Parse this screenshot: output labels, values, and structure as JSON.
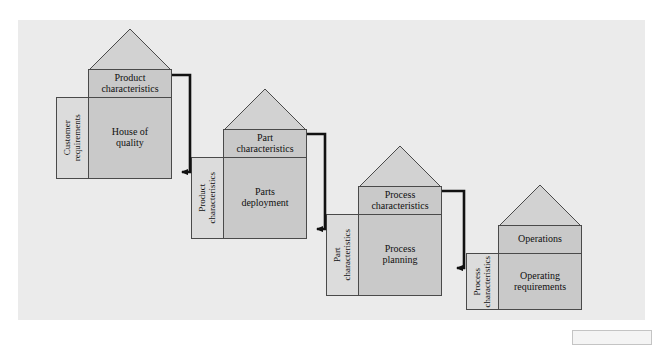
{
  "figure": {
    "panel": {
      "color": "#ebebeb",
      "x": 18,
      "y": 20,
      "width": 627,
      "height": 300
    },
    "colors": {
      "page_background": "#ffffff",
      "panel_background": "#ebebeb",
      "house_fill": "#c9c9c9",
      "roof_fill": "#d2d2d2",
      "side_fill": "#dcdcdc",
      "outline": "#4a4a4a",
      "arrow": "#111111",
      "text": "#101010"
    }
  },
  "houses": [
    {
      "id": "house-of-quality",
      "head_label": "Product\ncharacteristics",
      "head_line1": "Product",
      "head_line2": "characteristics",
      "body_label": "House of\nquality",
      "body_line1": "House of",
      "body_line2": "quality",
      "side_label": "Customer\nrequirements",
      "side_line1": "Customer",
      "side_line2": "requirements"
    },
    {
      "id": "parts-deployment",
      "head_label": "Part\ncharacteristics",
      "head_line1": "Part",
      "head_line2": "characteristics",
      "body_label": "Parts\ndeployment",
      "body_line1": "Parts",
      "body_line2": "deployment",
      "side_label": "Product\ncharacteristics",
      "side_line1": "Product",
      "side_line2": "characteristics"
    },
    {
      "id": "process-planning",
      "head_label": "Process\ncharacteristics",
      "head_line1": "Process",
      "head_line2": "characteristics",
      "body_label": "Process\nplanning",
      "body_line1": "Process",
      "body_line2": "planning",
      "side_label": "Part\ncharacteristics",
      "side_line1": "Part",
      "side_line2": "characteristics"
    },
    {
      "id": "operating-requirements",
      "head_label": "Operations",
      "head_line1": "Operations",
      "head_line2": "",
      "body_label": "Operating\nrequirements",
      "body_line1": "Operating",
      "body_line2": "requirements",
      "side_label": "Process\ncharacteristics",
      "side_line1": "Process",
      "side_line2": "characteristics"
    }
  ],
  "connectors": [
    {
      "id": "arrow-1",
      "from": "house-of-quality",
      "to": "parts-deployment"
    },
    {
      "id": "arrow-2",
      "from": "parts-deployment",
      "to": "process-planning"
    },
    {
      "id": "arrow-3",
      "from": "process-planning",
      "to": "operating-requirements"
    }
  ]
}
